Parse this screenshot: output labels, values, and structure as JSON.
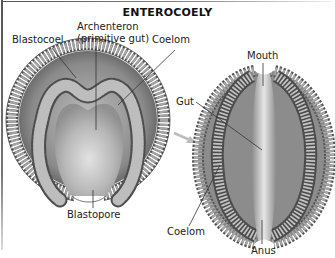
{
  "title": "ENTEROCOELY",
  "left_embryo": {
    "labels": {
      "blastocoel": "Blastocoel",
      "archenteron_line1": "Archenteron",
      "archenteron_line2": "(primitive gut)",
      "coelom": "Coelom",
      "blastopore": "Blastopore"
    }
  },
  "right_embryo": {
    "labels": {
      "mouth": "Mouth",
      "gut": "Gut",
      "coelom": "Coelom",
      "anus": "Anus"
    }
  },
  "colors": {
    "background": "#ffffff",
    "tissue_dark": "#5a5a5a",
    "tissue_mid": "#9a9a9a",
    "tissue_light": "#c8c8c8",
    "cavity": "#b5b5b5",
    "arrow": "#bdbdbd",
    "leader_lines": "#333333"
  }
}
